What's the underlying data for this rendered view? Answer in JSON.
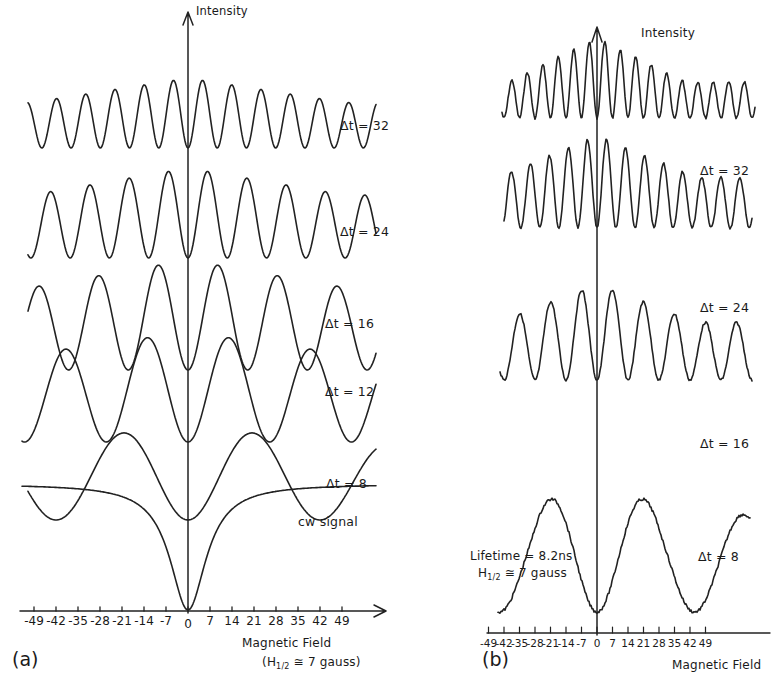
{
  "chart_data": [
    {
      "panel": "(a)",
      "type": "line",
      "title": "",
      "ylabel": "Intensity",
      "xlabel": "Magnetic Field",
      "xlabel_note": "(H1/2 ≅ 7 gauss)",
      "x_ticks": [
        "-49",
        "-42",
        "-35",
        "-28",
        "-21",
        "-14",
        "-7",
        "0",
        "7",
        "14",
        "21",
        "28",
        "35",
        "42",
        "49"
      ],
      "x_tick_values": [
        -49,
        -42,
        -35,
        -28,
        -21,
        -14,
        -7,
        0,
        7,
        14,
        21,
        28,
        35,
        42,
        49
      ],
      "xlim": [
        -54,
        62
      ],
      "grid": false,
      "legend": "none (curves labeled inline)",
      "series": [
        {
          "name": "Δt = 32",
          "description": "calculated quantum-beat signal, minimum at 0, fast oscillation (~8 peaks across)"
        },
        {
          "name": "Δt = 24",
          "description": "calculated quantum-beat signal, minimum at 0, ~6 peaks across"
        },
        {
          "name": "Δt = 16",
          "description": "calculated quantum-beat signal, minimum at 0, ~4 peaks across"
        },
        {
          "name": "Δt = 12",
          "description": "calculated quantum-beat signal, minimum at 0, ~3 peaks across"
        },
        {
          "name": "Δt = 8",
          "description": "calculated quantum-beat signal, minimum at 0, peaks near ±21"
        },
        {
          "name": "cw signal",
          "description": "Lorentzian-like dip centered at 0, flat wings"
        }
      ]
    },
    {
      "panel": "(b)",
      "type": "line",
      "title": "",
      "ylabel": "Intensity",
      "xlabel": "Magnetic Field",
      "x_ticks": [
        "-49",
        "-42",
        "-35",
        "-28",
        "-21",
        "-14",
        "-7",
        "0",
        "7",
        "14",
        "21",
        "28",
        "35",
        "42",
        "49"
      ],
      "x_tick_values": [
        -49,
        -42,
        -35,
        -28,
        -21,
        -14,
        -7,
        0,
        7,
        14,
        21,
        28,
        35,
        42,
        49
      ],
      "grid": false,
      "annotations": [
        "Lifetime = 8.2ns",
        "H1/2 ≅ 7 gauss"
      ],
      "series": [
        {
          "name": "Δt = 32",
          "description": "measured signal, noisy, fast oscillation, minimum at 0"
        },
        {
          "name": "Δt = 24",
          "description": "measured signal, noisy, minimum at 0"
        },
        {
          "name": "Δt = 16",
          "description": "measured signal, noisy, minimum at 0"
        },
        {
          "name": "Δt = 8",
          "description": "measured signal, noisy, broad peaks near ±21, minimum at 0"
        }
      ]
    }
  ],
  "panel_a": {
    "label": "(a)",
    "y_axis_label": "Intensity",
    "x_axis_label": "Magnetic Field",
    "x_axis_note_pre": "(H",
    "x_axis_note_sub": "1/2",
    "x_axis_note_post": " ≅ 7 gauss)",
    "curve_labels": [
      "Δt = 32",
      "Δt = 24",
      "Δt = 16",
      "Δt = 12",
      "Δt = 8",
      "cw signal"
    ],
    "ticks": [
      "-49",
      "-42",
      "-35",
      "-28",
      "-21",
      "-14",
      "-7",
      "0",
      "7",
      "14",
      "21",
      "28",
      "35",
      "42",
      "49"
    ]
  },
  "panel_b": {
    "label": "(b)",
    "y_axis_label": "Intensity",
    "x_axis_label": "Magnetic Field",
    "curve_labels": [
      "Δt = 32",
      "Δt = 24",
      "Δt = 16",
      "Δt = 8"
    ],
    "lifetime_text": "Lifetime = 8.2ns",
    "h_text_pre": "H",
    "h_text_sub": "1/2",
    "h_text_post": " ≅ 7 gauss",
    "ticks": [
      "-49",
      "-42",
      "-35",
      "-28",
      "-21",
      "-14",
      "-7",
      "0",
      "7",
      "14",
      "21",
      "28",
      "35",
      "42",
      "49"
    ]
  }
}
